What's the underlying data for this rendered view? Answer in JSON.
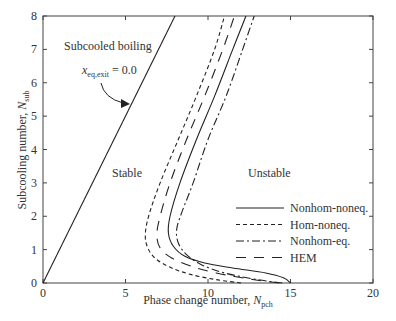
{
  "chart_data": {
    "type": "line",
    "title": "",
    "xlabel": "Phase change number, N_pch",
    "xlabel_main": "Phase change number, ",
    "xlabel_var": "N",
    "xlabel_sub": "pch",
    "ylabel": "Subcooling number, N_sub",
    "ylabel_main": "Subcooling number, ",
    "ylabel_var": "N",
    "ylabel_sub": "sub",
    "xlim": [
      0,
      20
    ],
    "ylim": [
      0,
      8
    ],
    "xticks": [
      "0",
      "5",
      "10",
      "15",
      "20"
    ],
    "yticks": [
      "0",
      "1",
      "2",
      "3",
      "4",
      "5",
      "6",
      "7",
      "8"
    ],
    "grid": false,
    "legend_position": "right-middle",
    "annotations": {
      "region_subcooled": "Subcooled boiling",
      "region_stable": "Stable",
      "region_unstable": "Unstable",
      "boundary_label_var": "x",
      "boundary_label_sub": "eq,exit",
      "boundary_label_value": " = 0.0"
    },
    "series": [
      {
        "name": "x_eq,exit = 0.0",
        "style": "solid",
        "x": [
          0,
          8
        ],
        "y": [
          0,
          8
        ]
      },
      {
        "name": "Nonhom-noneq.",
        "style": "solid",
        "x": [
          15.0,
          14.6,
          13.5,
          11.5,
          9.8,
          8.6,
          7.9,
          7.6,
          7.7,
          8.3,
          9.3,
          10.4,
          11.5,
          12.3
        ],
        "y": [
          0.0,
          0.15,
          0.3,
          0.45,
          0.6,
          0.8,
          1.1,
          1.5,
          2.0,
          3.0,
          4.3,
          5.6,
          7.0,
          8.0
        ]
      },
      {
        "name": "Hom-noneq.",
        "style": "dashed",
        "x": [
          12.0,
          10.5,
          9.0,
          7.8,
          6.9,
          6.4,
          6.2,
          6.4,
          7.1,
          8.2,
          9.3,
          10.4,
          11.0
        ],
        "y": [
          0.0,
          0.1,
          0.25,
          0.45,
          0.7,
          1.0,
          1.4,
          2.0,
          3.0,
          4.3,
          5.6,
          7.0,
          8.0
        ]
      },
      {
        "name": "Nonhom-eq.",
        "style": "dashdot",
        "x": [
          14.5,
          13.0,
          11.0,
          9.6,
          8.7,
          8.2,
          8.1,
          8.4,
          9.1,
          10.0,
          11.1,
          12.1,
          12.8
        ],
        "y": [
          0.0,
          0.1,
          0.3,
          0.55,
          0.85,
          1.2,
          1.6,
          2.1,
          3.0,
          4.3,
          5.6,
          7.0,
          8.0
        ]
      },
      {
        "name": "HEM",
        "style": "long-dash",
        "x": [
          14.3,
          12.5,
          10.5,
          9.0,
          7.8,
          7.1,
          6.9,
          7.1,
          7.7,
          8.7,
          9.8,
          10.9,
          11.6
        ],
        "y": [
          0.0,
          0.12,
          0.3,
          0.5,
          0.75,
          1.05,
          1.45,
          2.0,
          3.0,
          4.3,
          5.6,
          7.0,
          8.0
        ]
      }
    ]
  },
  "legend": [
    {
      "label": "Nonhom-noneq.",
      "dash": ""
    },
    {
      "label": "Hom-noneq.",
      "dash": "4,3"
    },
    {
      "label": "Nonhom-eq.",
      "dash": "8,3,2,3"
    },
    {
      "label": "HEM",
      "dash": "10,8"
    }
  ]
}
